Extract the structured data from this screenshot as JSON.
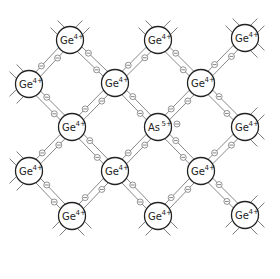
{
  "diagram": {
    "title": "",
    "colors": {
      "background": "#ffffff",
      "atom_stroke": "#222222",
      "bond_stroke": "#6a6a6a",
      "electron_stroke": "#666666"
    },
    "atom_radius": 13.5,
    "electron_radius": 3,
    "electron_symbol": "⊖",
    "atoms": [
      {
        "id": "a1",
        "x": 70,
        "y": 40,
        "element": "Ge",
        "charge": "4+"
      },
      {
        "id": "a2",
        "x": 158,
        "y": 40,
        "element": "Ge",
        "charge": "4+"
      },
      {
        "id": "a3",
        "x": 245,
        "y": 38,
        "element": "Ge",
        "charge": "4+"
      },
      {
        "id": "a4",
        "x": 29,
        "y": 84,
        "element": "Ge",
        "charge": "4+"
      },
      {
        "id": "a5",
        "x": 115,
        "y": 83,
        "element": "Ge",
        "charge": "4+"
      },
      {
        "id": "a6",
        "x": 201,
        "y": 83,
        "element": "Ge",
        "charge": "4+"
      },
      {
        "id": "a7",
        "x": 72,
        "y": 127,
        "element": "Ge",
        "charge": "4+"
      },
      {
        "id": "a8",
        "x": 158,
        "y": 127,
        "element": "As",
        "charge": "5+"
      },
      {
        "id": "a9",
        "x": 245,
        "y": 127,
        "element": "Ge",
        "charge": "4+"
      },
      {
        "id": "a10",
        "x": 29,
        "y": 171,
        "element": "Ge",
        "charge": "4+"
      },
      {
        "id": "a11",
        "x": 115,
        "y": 171,
        "element": "Ge",
        "charge": "4+"
      },
      {
        "id": "a12",
        "x": 201,
        "y": 171,
        "element": "Ge",
        "charge": "4+"
      },
      {
        "id": "a13",
        "x": 72,
        "y": 216,
        "element": "Ge",
        "charge": "4+"
      },
      {
        "id": "a14",
        "x": 158,
        "y": 216,
        "element": "Ge",
        "charge": "4+"
      },
      {
        "id": "a15",
        "x": 245,
        "y": 215,
        "element": "Ge",
        "charge": "4+"
      }
    ],
    "bonds": [
      [
        "a1",
        "a4"
      ],
      [
        "a1",
        "a5"
      ],
      [
        "a2",
        "a5"
      ],
      [
        "a2",
        "a6"
      ],
      [
        "a3",
        "a6"
      ],
      [
        "a4",
        "a7"
      ],
      [
        "a5",
        "a7"
      ],
      [
        "a5",
        "a8"
      ],
      [
        "a6",
        "a8"
      ],
      [
        "a6",
        "a9"
      ],
      [
        "a7",
        "a10"
      ],
      [
        "a7",
        "a11"
      ],
      [
        "a8",
        "a11"
      ],
      [
        "a8",
        "a12"
      ],
      [
        "a9",
        "a12"
      ],
      [
        "a10",
        "a13"
      ],
      [
        "a11",
        "a13"
      ],
      [
        "a11",
        "a14"
      ],
      [
        "a12",
        "a14"
      ],
      [
        "a12",
        "a15"
      ]
    ],
    "extra_electrons": [
      {
        "near": "a8",
        "x": 177,
        "y": 124,
        "label": "free donor electron"
      }
    ]
  }
}
